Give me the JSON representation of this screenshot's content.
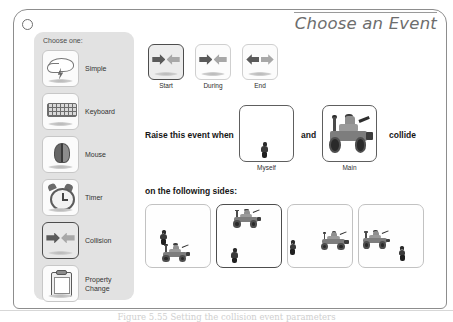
{
  "dialog": {
    "title": "Choose an Event",
    "close_icon": "close-circle-icon"
  },
  "sidebar": {
    "label": "Choose one:",
    "items": [
      {
        "label": "Simple",
        "icon": "cloud-lightning-icon",
        "selected": false
      },
      {
        "label": "Keyboard",
        "icon": "keyboard-icon",
        "selected": false
      },
      {
        "label": "Mouse",
        "icon": "mouse-icon",
        "selected": false
      },
      {
        "label": "Timer",
        "icon": "alarm-clock-icon",
        "selected": false
      },
      {
        "label": "Collision",
        "icon": "collision-arrows-icon",
        "selected": true
      },
      {
        "label": "Property\nChange",
        "icon": "clipboard-icon",
        "selected": false
      }
    ]
  },
  "timing": {
    "options": [
      {
        "label": "Start",
        "icon": "collision-arrows-icon",
        "selected": true
      },
      {
        "label": "During",
        "icon": "collision-arrows-icon",
        "selected": false
      },
      {
        "label": "End",
        "icon": "collision-arrows-apart-icon",
        "selected": false
      }
    ]
  },
  "condition": {
    "prefix": "Raise this event when",
    "conjunction": "and",
    "suffix": "collide",
    "object_a": {
      "caption": "Myself",
      "content": "minifigure-sprite"
    },
    "object_b": {
      "caption": "Main",
      "content": "rover-sprite"
    }
  },
  "sides": {
    "label": "on the following sides:",
    "options": [
      {
        "name": "side-option-1",
        "selected": false,
        "content": "minifig-above-rover"
      },
      {
        "name": "side-option-2",
        "selected": true,
        "content": "rover-above-minifig"
      },
      {
        "name": "side-option-3",
        "selected": false,
        "content": "minifig-left-rover"
      },
      {
        "name": "side-option-4",
        "selected": false,
        "content": "rover-left-minifig"
      }
    ]
  },
  "figure": {
    "caption": "Figure 5.55  Setting the collision event parameters"
  },
  "colors": {
    "panel_bg": "#e2e2e2",
    "selection_border": "#4d4d4d",
    "title_text": "#6d6d6d",
    "body_text": "#161616"
  }
}
